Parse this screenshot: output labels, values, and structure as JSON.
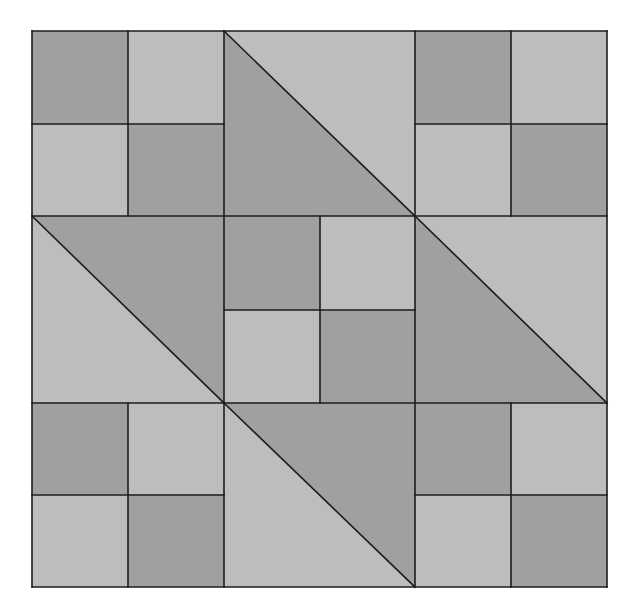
{
  "colors": {
    "dark": "#a0a0a0",
    "light": "#bdbdbd",
    "line": "#1c1c1c",
    "background": "#ffffff"
  },
  "grid": {
    "x": [
      32,
      224,
      415,
      607
    ],
    "y": [
      31,
      216,
      403,
      587
    ],
    "subdiv_x": [
      128,
      320,
      511
    ],
    "subdiv_y": [
      124,
      310,
      495
    ]
  },
  "blocks": [
    {
      "row": 0,
      "col": 0,
      "type": "four-patch",
      "cells": [
        "dark",
        "light",
        "light",
        "dark"
      ]
    },
    {
      "row": 0,
      "col": 1,
      "type": "half-square-triangle",
      "diagonal": "tl-br",
      "lower_left": "dark",
      "upper_right": "light"
    },
    {
      "row": 0,
      "col": 2,
      "type": "four-patch",
      "cells": [
        "dark",
        "light",
        "light",
        "dark"
      ]
    },
    {
      "row": 1,
      "col": 0,
      "type": "half-square-triangle",
      "diagonal": "tl-br",
      "lower_left": "light",
      "upper_right": "dark"
    },
    {
      "row": 1,
      "col": 1,
      "type": "four-patch",
      "cells": [
        "dark",
        "light",
        "light",
        "dark"
      ]
    },
    {
      "row": 1,
      "col": 2,
      "type": "half-square-triangle",
      "diagonal": "tl-br",
      "lower_left": "dark",
      "upper_right": "light"
    },
    {
      "row": 2,
      "col": 0,
      "type": "four-patch",
      "cells": [
        "dark",
        "light",
        "light",
        "dark"
      ]
    },
    {
      "row": 2,
      "col": 1,
      "type": "half-square-triangle",
      "diagonal": "tl-br",
      "lower_left": "light",
      "upper_right": "dark"
    },
    {
      "row": 2,
      "col": 2,
      "type": "four-patch",
      "cells": [
        "dark",
        "light",
        "light",
        "dark"
      ]
    }
  ]
}
